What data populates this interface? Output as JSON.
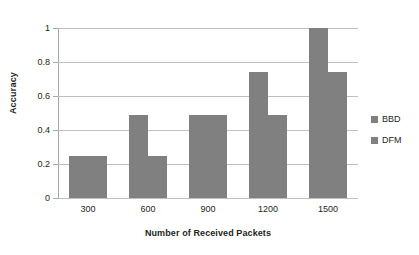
{
  "chart_data": {
    "type": "bar",
    "title": "",
    "subtitle": "",
    "xlabel": "Number of Received Packets",
    "ylabel": "Accuracy",
    "categories": [
      "300",
      "600",
      "900",
      "1200",
      "1500"
    ],
    "series": [
      {
        "name": "BBD",
        "values": [
          0.25,
          0.49,
          0.49,
          0.74,
          1.0
        ],
        "color": "#808080"
      },
      {
        "name": "DFM",
        "values": [
          0.25,
          0.25,
          0.49,
          0.49,
          0.74
        ],
        "color": "#808080"
      }
    ],
    "ylim": [
      0,
      1
    ],
    "yticks": [
      "0",
      "0.2",
      "0.4",
      "0.6",
      "0.8",
      "1"
    ],
    "ytick_values": [
      0,
      0.2,
      0.4,
      0.6,
      0.8,
      1
    ],
    "grid": true,
    "grid_axis": "y",
    "legend_position": "right",
    "bar_color": "#808080",
    "gridline_color": "#bfbfbf",
    "axis_color": "#a6a6a6",
    "background_color": "#ffffff",
    "text_color": "#231f20"
  },
  "legend": {
    "entries": [
      {
        "label": "BBD",
        "color": "#808080"
      },
      {
        "label": "DFM",
        "color": "#808080"
      }
    ]
  }
}
